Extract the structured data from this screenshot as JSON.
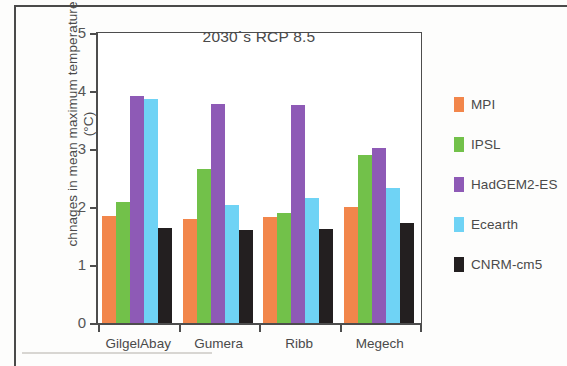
{
  "chart_data": {
    "type": "bar",
    "title": "2030`s RCP 8.5",
    "xlabel": "",
    "ylabel": "chnages in mean maximum temperature (°C)",
    "ylim": [
      0,
      5
    ],
    "yticks": [
      "0",
      "1",
      "2",
      "3",
      "4",
      "5"
    ],
    "grid": false,
    "legend_position": "right",
    "categories": [
      "GilgelAbay",
      "Gumera",
      "Ribb",
      "Megech"
    ],
    "series": [
      {
        "name": "MPI",
        "color": "#f2864b",
        "values": [
          1.85,
          1.8,
          1.83,
          2.0
        ]
      },
      {
        "name": "IPSL",
        "color": "#72c14a",
        "values": [
          2.08,
          2.65,
          1.9,
          2.89
        ]
      },
      {
        "name": "HadGEM2-ES",
        "color": "#8e5ab6",
        "values": [
          3.92,
          3.78,
          3.76,
          3.02
        ]
      },
      {
        "name": "Ecearth",
        "color": "#6fd3f5",
        "values": [
          3.86,
          2.03,
          2.16,
          2.32
        ]
      },
      {
        "name": "CNRM-cm5",
        "color": "#231f20",
        "values": [
          1.63,
          1.6,
          1.62,
          1.72
        ]
      }
    ]
  }
}
